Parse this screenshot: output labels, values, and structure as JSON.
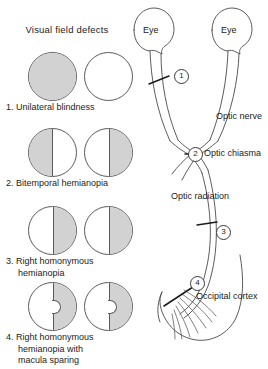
{
  "left_panel": {
    "heading": "Visual field defects",
    "rows": [
      {
        "number": "1",
        "caption_line1": "1. Unilateral blindness",
        "caption_line2": "",
        "caption_line3": "",
        "left_eye_shading": "full",
        "right_eye_shading": "none",
        "macula_sparing": false
      },
      {
        "number": "2",
        "caption_line1": "2. Bitemporal hemianopia",
        "caption_line2": "",
        "caption_line3": "",
        "left_eye_shading": "left-half",
        "right_eye_shading": "right-half",
        "macula_sparing": false
      },
      {
        "number": "3",
        "caption_line1": "3. Right homonymous",
        "caption_line2": "hemianopia",
        "caption_line3": "",
        "left_eye_shading": "right-half",
        "right_eye_shading": "right-half",
        "macula_sparing": false
      },
      {
        "number": "4",
        "caption_line1": "4. Right homonymous",
        "caption_line2": "hemianopia with",
        "caption_line3": "macula sparing",
        "left_eye_shading": "right-half",
        "right_eye_shading": "right-half",
        "macula_sparing": true
      }
    ]
  },
  "pathway": {
    "eye_left_label": "Eye",
    "eye_right_label": "Eye",
    "labels": {
      "optic_nerve": "Optic nerve",
      "optic_chiasma": "Optic chiasma",
      "optic_radiation": "Optic radiation",
      "occipital_cortex": "Occipital cortex"
    },
    "lesion_markers": [
      {
        "id": "1",
        "marker": "1",
        "site": "optic-nerve"
      },
      {
        "id": "2",
        "marker": "2",
        "site": "optic-chiasma"
      },
      {
        "id": "3",
        "marker": "3",
        "site": "optic-radiation"
      },
      {
        "id": "4",
        "marker": "4",
        "site": "occipital-cortex"
      }
    ]
  },
  "colors": {
    "shading": "#d2d2d2",
    "outline": "#5a5a5a",
    "text": "#1b1b1b"
  }
}
